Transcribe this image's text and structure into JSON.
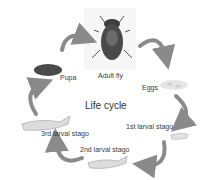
{
  "diagram": {
    "title": "Life cycle",
    "stages": [
      {
        "id": "adult",
        "label": "Adult fly",
        "icon": "fly-icon"
      },
      {
        "id": "eggs",
        "label": "Eggs",
        "icon": "eggs-icon"
      },
      {
        "id": "larva1",
        "label": "1st larval stago",
        "icon": "larva-icon"
      },
      {
        "id": "larva2",
        "label": "2nd larval stago",
        "icon": "larva-icon"
      },
      {
        "id": "larva3",
        "label": "3rd larval stago",
        "icon": "larva-icon"
      },
      {
        "id": "pupa",
        "label": "Pupa",
        "icon": "pupa-icon"
      }
    ],
    "colors": {
      "arrow": "#8a8a8a",
      "fly_body": "#3d3d3d",
      "pupa": "#4a4a4a",
      "larva": "#d8d8d8"
    }
  }
}
